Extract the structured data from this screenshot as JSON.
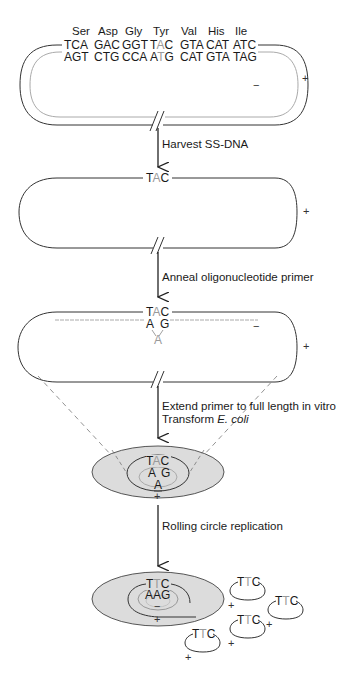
{
  "figure": {
    "stage1": {
      "amino_acids": [
        "Ser",
        "Asp",
        "Gly",
        "Tyr",
        "Val",
        "His",
        "Ile"
      ],
      "plus_strand_codons": [
        "TCA",
        "GAC",
        "GGT",
        "TAC",
        "GTA",
        "CAT",
        "ATC"
      ],
      "minus_strand_codons": [
        "AGT",
        "CTG",
        "CCA",
        "ATG",
        "CAT",
        "GTA",
        "TAG"
      ],
      "highlight_codon_index": 3,
      "highlight_base_position": 1,
      "minus_label": "−",
      "plus_label": "+"
    },
    "arrow1": {
      "label": "Harvest SS-DNA"
    },
    "stage2": {
      "codon": {
        "pre": "T",
        "mid": "A",
        "post": "C"
      },
      "plus_label": "+"
    },
    "arrow2": {
      "label": "Anneal oligonucleotide primer"
    },
    "stage3": {
      "codon": {
        "pre": "T",
        "mid": "A",
        "post": "C"
      },
      "primer_left": "A",
      "primer_right": "G",
      "mismatch_base": "A",
      "minus_label": "−",
      "plus_label": "+"
    },
    "arrow3": {
      "label_line1": "Extend primer to full length in vitro",
      "label_line2_prefix": "Transform ",
      "label_line2_italic": "E. coli"
    },
    "stage4": {
      "codon": {
        "pre": "T",
        "mid": "A",
        "post": "C"
      },
      "primer_left": "A",
      "primer_right": "G",
      "mismatch_base": "A",
      "plus_label": "+"
    },
    "arrow4": {
      "label": "Rolling circle replication"
    },
    "stage5": {
      "codon": {
        "pre": "T",
        "mid": "T",
        "post": "C"
      },
      "complement": "AAG",
      "minus_label": "−",
      "plus_label": "+",
      "progeny": [
        {
          "codon_pre": "T",
          "codon_mid": "T",
          "codon_post": "C",
          "sign": "+"
        },
        {
          "codon_pre": "T",
          "codon_mid": "T",
          "codon_post": "C",
          "sign": "+"
        },
        {
          "codon_pre": "T",
          "codon_mid": "T",
          "codon_post": "C",
          "sign": "+"
        },
        {
          "codon_pre": "T",
          "codon_mid": "T",
          "codon_post": "C",
          "sign": "+"
        }
      ]
    },
    "colors": {
      "line": "#333333",
      "highlight_base": "#9a9a9a",
      "minus_strand": "#aaaaaa",
      "cell_fill": "#dcdcdc"
    }
  }
}
